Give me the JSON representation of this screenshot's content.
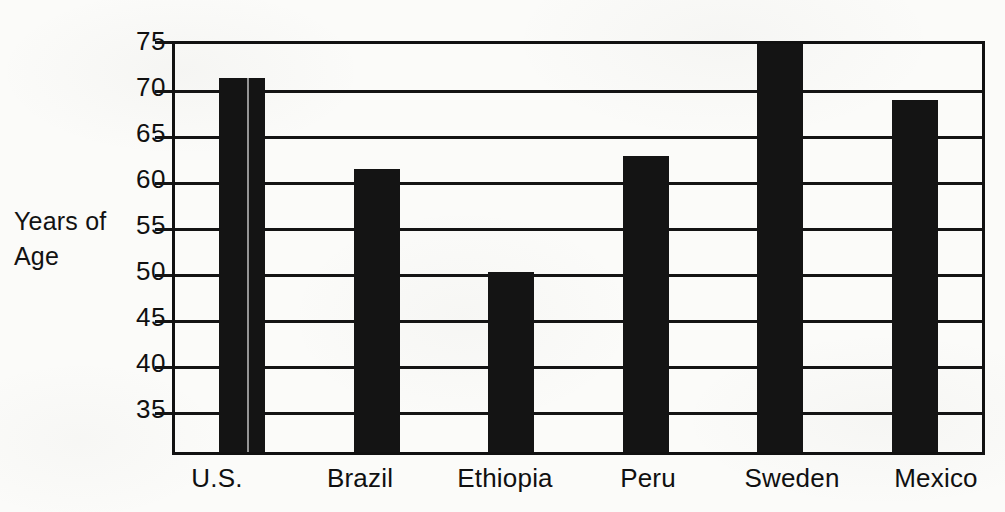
{
  "chart_data": {
    "type": "bar",
    "title": "",
    "subtitle": "",
    "xlabel": "",
    "ylabel": "Years of Age",
    "ylabel_lines": [
      "Years of",
      "Age"
    ],
    "categories": [
      "U.S.",
      "Brazil",
      "Ethiopia",
      "Peru",
      "Sweden",
      "Mexico"
    ],
    "values": [
      71.3,
      61.3,
      50.0,
      62.7,
      75.0,
      68.8
    ],
    "series": [
      {
        "name": "Life expectancy",
        "values": [
          71.3,
          61.3,
          50.0,
          62.7,
          75.0,
          68.8
        ]
      }
    ],
    "ytick_labels": [
      "75",
      "70",
      "65",
      "60",
      "55",
      "50",
      "45",
      "40",
      "35"
    ],
    "yticks": [
      75,
      70,
      65,
      60,
      55,
      50,
      45,
      40,
      35
    ],
    "ylim": [
      30.2,
      75.0
    ],
    "grid": "horizontal",
    "legend": "none",
    "bar_color": "#141414",
    "axis_color": "#111111",
    "background_color": "#fbfbf9"
  }
}
